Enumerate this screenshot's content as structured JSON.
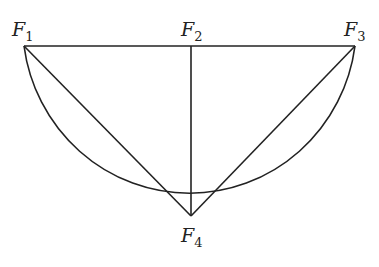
{
  "diagram": {
    "type": "geometric-figure",
    "stroke_color": "#222222",
    "nodes": [
      {
        "id": "F1",
        "letter": "F",
        "sub": "1",
        "x": 24,
        "y": 46
      },
      {
        "id": "F2",
        "letter": "F",
        "sub": "2",
        "x": 191,
        "y": 46
      },
      {
        "id": "F3",
        "letter": "F",
        "sub": "3",
        "x": 355,
        "y": 46
      },
      {
        "id": "F4",
        "letter": "F",
        "sub": "4",
        "x": 191,
        "y": 216
      }
    ],
    "edges": [
      {
        "from": "F1",
        "to": "F3",
        "kind": "line"
      },
      {
        "from": "F2",
        "to": "F4",
        "kind": "line"
      },
      {
        "from": "F1",
        "to": "F4",
        "kind": "line"
      },
      {
        "from": "F3",
        "to": "F4",
        "kind": "line"
      },
      {
        "from": "F1",
        "to": "F3",
        "kind": "arc",
        "through": "F4"
      }
    ]
  }
}
